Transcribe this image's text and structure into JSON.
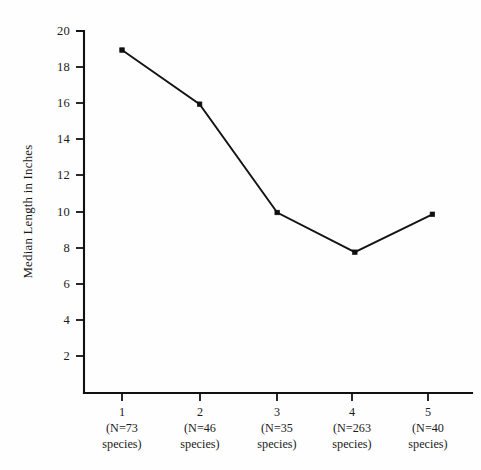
{
  "chart_data": {
    "type": "line",
    "title": "",
    "xlabel": "",
    "ylabel": "Median Length in Inches",
    "categories": [
      "1",
      "2",
      "3",
      "4",
      "5"
    ],
    "category_sublabels": [
      {
        "n_text": "(N=73",
        "species_text": "species)"
      },
      {
        "n_text": "(N=46",
        "species_text": "species)"
      },
      {
        "n_text": "(N=35",
        "species_text": "species)"
      },
      {
        "n_text": "(N=263",
        "species_text": "species)"
      },
      {
        "n_text": "(N=40",
        "species_text": "species)"
      }
    ],
    "sample_sizes": [
      73,
      46,
      35,
      263,
      40
    ],
    "values": [
      19,
      16,
      10,
      7.8,
      9.9
    ],
    "x": [
      1,
      2,
      3,
      4,
      5
    ],
    "ylim": [
      0,
      20
    ],
    "xlim": [
      0.5,
      5.5
    ],
    "yticks": [
      2,
      4,
      6,
      8,
      10,
      12,
      14,
      16,
      18,
      20
    ],
    "ytick_labels": [
      "2",
      "4",
      "6",
      "8",
      "10",
      "12",
      "14",
      "16",
      "18",
      "20"
    ],
    "grid": false,
    "legend": false,
    "legend_position": "none",
    "marker": "square",
    "line_color": "#141414",
    "marker_color": "#101010",
    "axis_color": "#111111",
    "background_color": "#fefefe"
  },
  "ylabel_text": "Median Length in Inches"
}
